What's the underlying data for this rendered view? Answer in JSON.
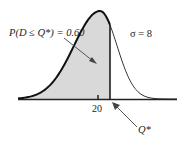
{
  "diagram": {
    "probability_label": "P(D ≤ Q*) = 0.60",
    "sigma_label": "σ = 8",
    "mean_label": "20",
    "q_star_label": "Q*",
    "mean": 20,
    "sigma": 8,
    "probability": 0.6,
    "colors": {
      "shade": "#d9d9d9",
      "curve": "#111111",
      "axis": "#222222"
    }
  }
}
